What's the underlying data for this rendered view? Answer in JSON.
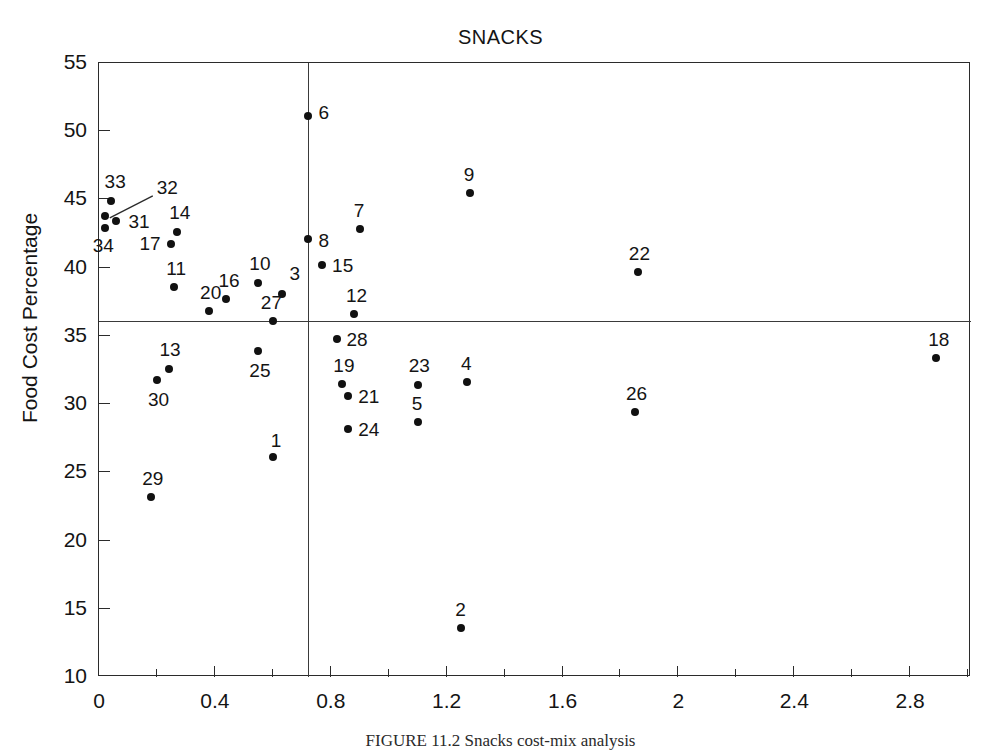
{
  "chart_data": {
    "type": "scatter",
    "title": "SNACKS",
    "xlabel": "",
    "ylabel": "Food Cost Percentage",
    "xlim": [
      0,
      3.01
    ],
    "ylim": [
      10,
      55
    ],
    "grid": false,
    "legend": false,
    "x_major_ticks": [
      "0",
      "0.4",
      "0.8",
      "1.2",
      "1.6",
      "2",
      "2.4",
      "2.8"
    ],
    "x_major_values": [
      0,
      0.4,
      0.8,
      1.2,
      1.6,
      2.0,
      2.4,
      2.8
    ],
    "x_minor_values": [
      0.2,
      0.6,
      1.0,
      1.4,
      1.8,
      2.2,
      2.6,
      3.0
    ],
    "y_ticks": [
      "10",
      "15",
      "20",
      "25",
      "30",
      "35",
      "40",
      "45",
      "50",
      "55"
    ],
    "y_values": [
      10,
      15,
      20,
      25,
      30,
      35,
      40,
      45,
      50,
      55
    ],
    "reference_lines": {
      "vertical_x": 0.72,
      "horizontal_y": 36.1
    },
    "point_label_key": "Item number",
    "points": [
      {
        "label": "1",
        "x": 0.6,
        "y": 26.1,
        "lx": -2,
        "ly": -26
      },
      {
        "label": "2",
        "x": 1.25,
        "y": 13.6,
        "lx": -6,
        "ly": -28
      },
      {
        "label": "3",
        "x": 0.63,
        "y": 38.1,
        "lx": 8,
        "ly": -30
      },
      {
        "label": "4",
        "x": 1.27,
        "y": 31.6,
        "lx": -6,
        "ly": -28
      },
      {
        "label": "5",
        "x": 1.1,
        "y": 28.7,
        "lx": -6,
        "ly": -28
      },
      {
        "label": "6",
        "x": 0.72,
        "y": 51.1,
        "lx": 11,
        "ly": -13
      },
      {
        "label": "7",
        "x": 0.9,
        "y": 42.8,
        "lx": -6,
        "ly": -28
      },
      {
        "label": "8",
        "x": 0.72,
        "y": 42.1,
        "lx": 11,
        "ly": -8
      },
      {
        "label": "9",
        "x": 1.28,
        "y": 45.5,
        "lx": -6,
        "ly": -28
      },
      {
        "label": "10",
        "x": 0.55,
        "y": 38.9,
        "lx": -9,
        "ly": -29
      },
      {
        "label": "11",
        "x": 0.26,
        "y": 38.6,
        "lx": -8,
        "ly": -28
      },
      {
        "label": "12",
        "x": 0.88,
        "y": 36.6,
        "lx": -8,
        "ly": -28
      },
      {
        "label": "13",
        "x": 0.24,
        "y": 32.6,
        "lx": -9,
        "ly": -29
      },
      {
        "label": "14",
        "x": 0.27,
        "y": 42.6,
        "lx": -8,
        "ly": -29
      },
      {
        "label": "15",
        "x": 0.77,
        "y": 40.2,
        "lx": 10,
        "ly": -9
      },
      {
        "label": "16",
        "x": 0.44,
        "y": 37.7,
        "lx": -8,
        "ly": -28
      },
      {
        "label": "17",
        "x": 0.25,
        "y": 41.7,
        "lx": -32,
        "ly": -10
      },
      {
        "label": "18",
        "x": 2.89,
        "y": 33.4,
        "lx": -8,
        "ly": -28
      },
      {
        "label": "19",
        "x": 0.84,
        "y": 31.5,
        "lx": -9,
        "ly": -28
      },
      {
        "label": "20",
        "x": 0.38,
        "y": 36.8,
        "lx": -9,
        "ly": -28
      },
      {
        "label": "21",
        "x": 0.86,
        "y": 30.6,
        "lx": 10,
        "ly": -9
      },
      {
        "label": "22",
        "x": 1.86,
        "y": 39.7,
        "lx": -9,
        "ly": -28
      },
      {
        "label": "23",
        "x": 1.1,
        "y": 31.4,
        "lx": -9,
        "ly": -29
      },
      {
        "label": "24",
        "x": 0.86,
        "y": 28.2,
        "lx": 10,
        "ly": -9
      },
      {
        "label": "25",
        "x": 0.55,
        "y": 33.9,
        "lx": -9,
        "ly": 10
      },
      {
        "label": "26",
        "x": 1.85,
        "y": 29.4,
        "lx": -9,
        "ly": -28
      },
      {
        "label": "27",
        "x": 0.6,
        "y": 36.1,
        "lx": -12,
        "ly": -28
      },
      {
        "label": "28",
        "x": 0.82,
        "y": 34.8,
        "lx": 10,
        "ly": -9
      },
      {
        "label": "29",
        "x": 0.18,
        "y": 23.2,
        "lx": -9,
        "ly": -28
      },
      {
        "label": "30",
        "x": 0.2,
        "y": 31.8,
        "lx": -9,
        "ly": 10
      },
      {
        "label": "31",
        "x": 0.06,
        "y": 43.4,
        "lx": 12,
        "ly": -9
      },
      {
        "label": "32",
        "x": 0.02,
        "y": 43.8,
        "lx": 52,
        "ly": -38
      },
      {
        "label": "33",
        "x": 0.04,
        "y": 44.9,
        "lx": -6,
        "ly": -29
      },
      {
        "label": "34",
        "x": 0.02,
        "y": 42.9,
        "lx": -12,
        "ly": 8
      }
    ],
    "annotations": [
      {
        "type": "leader-line",
        "from_label": "32",
        "comment": "diagonal leader from label 32 down-left to its marker"
      }
    ]
  },
  "caption": {
    "figure_label": "FIGURE",
    "text": "FIGURE 11.2  Snacks cost-mix analysis"
  }
}
